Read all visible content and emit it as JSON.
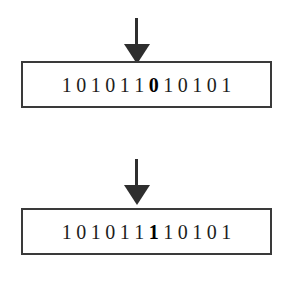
{
  "figure": {
    "background_color": "#ffffff",
    "ink_color": "#2e2e2e",
    "text_color": "#1d1d1d"
  },
  "stages": [
    {
      "name": "before-flip",
      "arrow": {
        "icon": "down-arrow-icon",
        "direction": "down",
        "points_to_bit_index": 6
      },
      "bitstring": {
        "value": "101011010101",
        "length": 12,
        "bits": [
          "1",
          "0",
          "1",
          "0",
          "1",
          "1",
          "0",
          "1",
          "0",
          "1",
          "0",
          "1"
        ],
        "highlight_index": 6,
        "highlight_value": "0"
      }
    },
    {
      "name": "after-flip",
      "arrow": {
        "icon": "down-arrow-icon",
        "direction": "down",
        "points_to_bit_index": 6
      },
      "bitstring": {
        "value": "101011110101",
        "length": 12,
        "bits": [
          "1",
          "0",
          "1",
          "0",
          "1",
          "1",
          "1",
          "1",
          "0",
          "1",
          "0",
          "1"
        ],
        "highlight_index": 6,
        "highlight_value": "1"
      }
    }
  ]
}
